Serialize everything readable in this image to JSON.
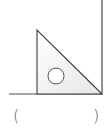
{
  "diagram": {
    "colors": {
      "line": "#4a4a4a",
      "triangle_fill": "#f2f2f2",
      "triangle_stroke": "#3c3c3c",
      "hole_stroke": "#555555",
      "background": "#ffffff"
    },
    "horizontal_line": {
      "x1": 9,
      "y1": 94,
      "x2": 102,
      "y2": 94
    },
    "vertical_line": {
      "x1": 102,
      "y1": 0,
      "x2": 102,
      "y2": 94
    },
    "triangle": {
      "points": "37,30 37,94 102,94"
    },
    "hole": {
      "cx": 56,
      "cy": 76,
      "r": 8
    }
  },
  "answer_blank": {
    "open": "(",
    "close": ")"
  }
}
